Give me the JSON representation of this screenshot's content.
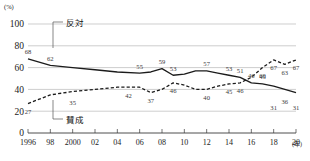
{
  "chart_data": {
    "type": "line",
    "title": "",
    "xlabel": "年",
    "ylabel": "(%)",
    "ylim": [
      0,
      100
    ],
    "yticks": [
      0,
      20,
      40,
      60,
      80,
      100
    ],
    "xlim": [
      1996,
      2020
    ],
    "xticks": [
      1996,
      1998,
      2000,
      2002,
      2004,
      2006,
      2008,
      2010,
      2012,
      2014,
      2016,
      2018,
      2020
    ],
    "xtick_labels": [
      "1996",
      "98",
      "2000",
      "02",
      "04",
      "06",
      "08",
      "10",
      "12",
      "14",
      "16",
      "18",
      "20"
    ],
    "grid": "horizontal",
    "legend_position": "inline-annotation",
    "series": [
      {
        "name": "反対",
        "style": "solid",
        "x": [
          1996,
          1998,
          2000,
          2002,
          2004,
          2006,
          2007,
          2008,
          2009,
          2010,
          2011,
          2012,
          2013,
          2014,
          2015,
          2016,
          2017,
          2018,
          2019,
          2020
        ],
        "values": [
          68,
          62,
          60,
          58,
          56,
          55,
          56,
          59,
          53,
          54,
          57,
          57,
          55,
          53,
          51,
          46,
          45,
          43,
          40,
          37
        ],
        "labels": [
          {
            "x": 1996,
            "v": 68
          },
          {
            "x": 1998,
            "v": 62
          },
          {
            "x": 2006,
            "v": 55
          },
          {
            "x": 2008,
            "v": 59
          },
          {
            "x": 2009,
            "v": 53
          },
          {
            "x": 2012,
            "v": 57
          },
          {
            "x": 2014,
            "v": 53
          },
          {
            "x": 2015,
            "v": 51
          },
          {
            "x": 2016,
            "v": 46
          },
          {
            "x": 2017,
            "v": 45
          }
        ]
      },
      {
        "name": "賛成",
        "style": "dashed",
        "x": [
          1996,
          1998,
          2000,
          2002,
          2004,
          2006,
          2007,
          2008,
          2009,
          2010,
          2011,
          2012,
          2013,
          2014,
          2015,
          2016,
          2017,
          2018,
          2019,
          2020
        ],
        "values": [
          27,
          35,
          38,
          40,
          42,
          42,
          37,
          40,
          46,
          44,
          40,
          40,
          43,
          45,
          46,
          51,
          60,
          67,
          63,
          67
        ],
        "labels": [
          {
            "x": 1996,
            "v": 27
          },
          {
            "x": 2000,
            "v": 35
          },
          {
            "x": 2005,
            "v": 42
          },
          {
            "x": 2007,
            "v": 37
          },
          {
            "x": 2009,
            "v": 46
          },
          {
            "x": 2012,
            "v": 40
          },
          {
            "x": 2014,
            "v": 45
          },
          {
            "x": 2015,
            "v": 46
          },
          {
            "x": 2017,
            "v": 60
          },
          {
            "x": 2018,
            "v": 67
          },
          {
            "x": 2019,
            "v": 63
          },
          {
            "x": 2020,
            "v": 67
          }
        ]
      }
    ],
    "tail_labels_solid": [
      {
        "x": 2018,
        "v": 31
      },
      {
        "x": 2019,
        "v": 36
      },
      {
        "x": 2020,
        "v": 31
      }
    ],
    "annotations": [
      {
        "text": "反対",
        "role": "series-label-solid"
      },
      {
        "text": "賛成",
        "role": "series-label-dashed"
      }
    ]
  },
  "axis": {
    "y_unit": "(%)",
    "y_labels": [
      "100",
      "80",
      "60",
      "40",
      "20",
      "0"
    ],
    "x_labels": [
      "1996",
      "98",
      "2000",
      "02",
      "04",
      "06",
      "08",
      "10",
      "12",
      "14",
      "16",
      "18",
      "20"
    ],
    "x_unit": "(年)"
  },
  "legend": {
    "oppose": "反対",
    "agree": "賛成"
  },
  "caption": {
    "text": ""
  }
}
